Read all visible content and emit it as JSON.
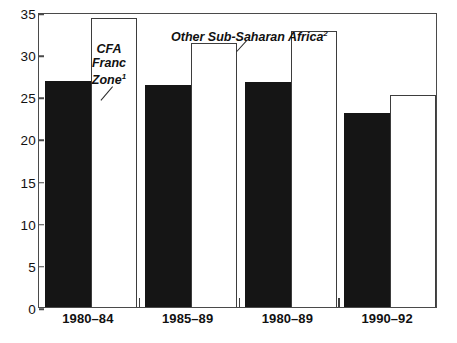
{
  "chart_data": {
    "type": "bar",
    "title": "",
    "subtitle": "",
    "xlabel": "",
    "ylabel": "",
    "ylim": [
      0,
      35
    ],
    "yticks": [
      0,
      5,
      10,
      15,
      20,
      25,
      30,
      35
    ],
    "ytick_labels": [
      "0",
      "5",
      "10",
      "15",
      "20",
      "25",
      "30",
      "35"
    ],
    "grid": false,
    "legend_position": "inline-annotations",
    "categories": [
      "1980–84",
      "1985–89",
      "1980–89",
      "1990–92"
    ],
    "series": [
      {
        "name": "CFA Franc Zone",
        "footnote": "1",
        "fill": "#151515",
        "style": "solid-black",
        "values": [
          26.8,
          26.3,
          26.7,
          23.0
        ]
      },
      {
        "name": "Other Sub-Saharan Africa",
        "footnote": "2",
        "fill": "#ffffff",
        "style": "outlined-white",
        "values": [
          34.3,
          31.3,
          32.7,
          25.2
        ]
      }
    ],
    "annotations": [
      {
        "id": "cfa-franc-zone",
        "lines": [
          "CFA",
          "Franc",
          "Zone"
        ],
        "footnote": "1",
        "points_to": "series-0-bar-0"
      },
      {
        "id": "other-sub-saharan-africa",
        "lines": [
          "Other Sub-Saharan Africa"
        ],
        "footnote": "2",
        "points_to": "series-1-bar-1"
      }
    ]
  },
  "axis": {
    "y_labels": [
      "35",
      "30",
      "25",
      "20",
      "15",
      "10",
      "5",
      "0"
    ],
    "x_labels": [
      "1980–84",
      "1985–89",
      "1980–89",
      "1990–92"
    ]
  },
  "annotations": {
    "cfa": {
      "l1": "CFA",
      "l2": "Franc",
      "l3": "Zone",
      "sup": "1"
    },
    "other": {
      "text": "Other Sub-Saharan Africa",
      "sup": "2"
    }
  },
  "colors": {
    "series_dark": "#151515",
    "series_light": "#ffffff",
    "axis": "#4a4a4a",
    "text": "#111111"
  }
}
